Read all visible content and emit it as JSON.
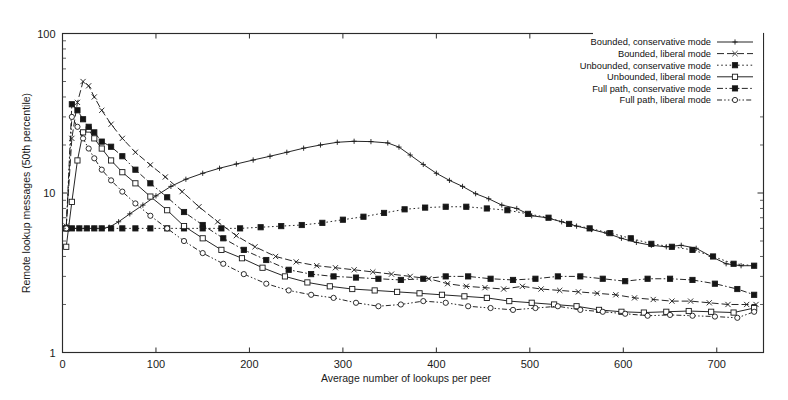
{
  "figure": {
    "background": "#ffffff",
    "ink_color": "#1a1a1a"
  },
  "axes": {
    "xlabel": "Average number of lookups per peer",
    "ylabel": "Remote lookup messages (50th percentile)",
    "x_ticks": [
      "0",
      "100",
      "200",
      "300",
      "400",
      "500",
      "600",
      "700"
    ],
    "y_ticks": [
      "1",
      "10",
      "100"
    ],
    "x_range": [
      0,
      750
    ],
    "y_range": [
      1,
      100
    ],
    "y_scale": "log",
    "x_scale": "linear",
    "grid": "off"
  },
  "legend": {
    "position": "top-right inside",
    "entries": [
      {
        "label": "Bounded, conservative mode",
        "marker": "plus",
        "dash": "solid"
      },
      {
        "label": "Bounded, liberal mode",
        "marker": "cross",
        "dash": "dashed"
      },
      {
        "label": "Unbounded, conservative mode",
        "marker": "filled-square-dot",
        "dash": "dotted"
      },
      {
        "label": "Unbounded, liberal mode",
        "marker": "open-square",
        "dash": "solid"
      },
      {
        "label": "Full path, conservative mode",
        "marker": "filled-square",
        "dash": "dash-dot"
      },
      {
        "label": "Full path, liberal mode",
        "marker": "open-circle",
        "dash": "dash-dot-dot"
      }
    ]
  },
  "chart_data": {
    "type": "line",
    "title": "",
    "xlabel": "Average number of lookups per peer",
    "ylabel": "Remote lookup messages (50th percentile)",
    "xlim": [
      0,
      750
    ],
    "ylim": [
      1,
      100
    ],
    "y_scale": "log",
    "grid": false,
    "legend_position": "top-right",
    "series": [
      {
        "name": "Bounded, conservative mode",
        "marker": "plus",
        "linestyle": "solid",
        "x": [
          4,
          10,
          18,
          26,
          34,
          42,
          50,
          60,
          72,
          86,
          100,
          116,
          132,
          150,
          168,
          186,
          204,
          222,
          240,
          258,
          276,
          294,
          312,
          330,
          348,
          360,
          372,
          386,
          400,
          414,
          428,
          442,
          456,
          470,
          486,
          502,
          518,
          534,
          550,
          566,
          582,
          598,
          614,
          630,
          646,
          662,
          678,
          694,
          710,
          726,
          740
        ],
        "y": [
          6.0,
          6.0,
          6.0,
          6.0,
          6.0,
          6.0,
          6.1,
          6.6,
          7.4,
          8.4,
          9.6,
          11.0,
          12.2,
          13.3,
          14.3,
          15.2,
          16.1,
          17.0,
          18.0,
          19.1,
          20.0,
          20.8,
          21.1,
          21.0,
          20.6,
          19.4,
          17.3,
          15.1,
          13.3,
          12.0,
          11.0,
          9.9,
          9.2,
          8.4,
          8.0,
          7.2,
          7.0,
          6.6,
          6.2,
          5.9,
          5.6,
          5.2,
          4.9,
          4.7,
          4.6,
          4.7,
          4.5,
          4.0,
          3.6,
          3.5,
          3.5
        ]
      },
      {
        "name": "Bounded, liberal mode",
        "marker": "cross",
        "linestyle": "dashed",
        "x": [
          4,
          10,
          16,
          22,
          28,
          34,
          42,
          52,
          64,
          78,
          94,
          110,
          128,
          146,
          166,
          186,
          206,
          228,
          250,
          272,
          292,
          312,
          332,
          352,
          372,
          392,
          412,
          432,
          452,
          472,
          492,
          512,
          532,
          552,
          572,
          592,
          612,
          632,
          652,
          672,
          692,
          712,
          732,
          742
        ],
        "y": [
          6.2,
          22.0,
          37.0,
          50.0,
          47.0,
          40.0,
          33.0,
          27.0,
          22.0,
          18.0,
          15.0,
          12.6,
          10.2,
          8.2,
          6.6,
          5.4,
          4.6,
          4.0,
          3.7,
          3.5,
          3.4,
          3.3,
          3.2,
          3.1,
          3.0,
          2.9,
          2.7,
          2.6,
          2.55,
          2.5,
          2.6,
          2.5,
          2.45,
          2.4,
          2.35,
          2.3,
          2.2,
          2.15,
          2.1,
          2.1,
          2.05,
          2.0,
          2.0,
          2.0
        ]
      },
      {
        "name": "Unbounded, conservative mode",
        "marker": "filled-square-dot",
        "linestyle": "dotted",
        "x": [
          4,
          10,
          18,
          26,
          34,
          42,
          52,
          64,
          78,
          94,
          112,
          130,
          150,
          170,
          190,
          212,
          234,
          256,
          278,
          300,
          322,
          344,
          366,
          388,
          410,
          432,
          454,
          476,
          498,
          520,
          542,
          564,
          586,
          608,
          630,
          652,
          674,
          696,
          718,
          740
        ],
        "y": [
          6.0,
          6.0,
          6.0,
          6.0,
          6.0,
          6.0,
          6.0,
          6.0,
          6.0,
          6.0,
          6.0,
          6.0,
          6.0,
          6.0,
          6.0,
          6.1,
          6.2,
          6.3,
          6.5,
          6.8,
          7.1,
          7.5,
          7.9,
          8.1,
          8.2,
          8.2,
          8.0,
          7.8,
          7.4,
          7.0,
          6.4,
          6.0,
          5.6,
          5.2,
          4.8,
          4.6,
          4.4,
          4.0,
          3.6,
          3.5
        ]
      },
      {
        "name": "Unbounded, liberal mode",
        "marker": "open-square",
        "linestyle": "solid",
        "x": [
          4,
          10,
          16,
          22,
          28,
          34,
          42,
          52,
          64,
          78,
          94,
          112,
          130,
          150,
          170,
          192,
          214,
          238,
          262,
          286,
          310,
          334,
          358,
          382,
          406,
          430,
          454,
          478,
          502,
          526,
          550,
          574,
          598,
          622,
          646,
          670,
          694,
          718,
          740
        ],
        "y": [
          4.6,
          8.8,
          16.0,
          24.0,
          25.0,
          22.0,
          19.0,
          16.0,
          13.5,
          11.5,
          9.5,
          7.8,
          6.2,
          5.2,
          4.4,
          3.9,
          3.4,
          3.0,
          2.75,
          2.6,
          2.5,
          2.45,
          2.4,
          2.35,
          2.3,
          2.25,
          2.2,
          2.1,
          2.05,
          2.0,
          1.95,
          1.85,
          1.8,
          1.78,
          1.8,
          1.82,
          1.8,
          1.78,
          1.9
        ]
      },
      {
        "name": "Full path, conservative mode",
        "marker": "filled-square",
        "linestyle": "dash-dot",
        "x": [
          4,
          10,
          16,
          22,
          28,
          34,
          42,
          52,
          64,
          78,
          94,
          112,
          130,
          150,
          172,
          194,
          218,
          242,
          266,
          290,
          314,
          338,
          362,
          386,
          410,
          434,
          458,
          482,
          506,
          530,
          554,
          578,
          602,
          626,
          650,
          674,
          698,
          722,
          740
        ],
        "y": [
          6.0,
          36.0,
          33.0,
          29.0,
          26.0,
          24.0,
          21.0,
          19.5,
          17.0,
          14.0,
          11.5,
          9.4,
          7.6,
          6.3,
          5.2,
          4.4,
          3.8,
          3.3,
          3.1,
          3.0,
          2.95,
          2.9,
          2.85,
          2.9,
          3.0,
          3.0,
          2.9,
          2.85,
          2.9,
          3.0,
          3.0,
          2.9,
          2.8,
          2.9,
          2.9,
          2.85,
          2.7,
          2.5,
          2.3
        ]
      },
      {
        "name": "Full path, liberal mode",
        "marker": "open-circle",
        "linestyle": "dash-dot-dot",
        "x": [
          4,
          10,
          16,
          22,
          28,
          34,
          42,
          52,
          64,
          78,
          94,
          112,
          130,
          150,
          172,
          194,
          218,
          242,
          266,
          290,
          314,
          338,
          362,
          386,
          410,
          434,
          458,
          482,
          506,
          530,
          554,
          578,
          602,
          626,
          650,
          674,
          698,
          722,
          740
        ],
        "y": [
          6.0,
          30.0,
          26.0,
          22.0,
          19.0,
          16.5,
          14.0,
          12.0,
          10.2,
          8.6,
          7.2,
          6.0,
          5.0,
          4.2,
          3.6,
          3.1,
          2.7,
          2.45,
          2.3,
          2.2,
          2.05,
          1.95,
          2.0,
          2.1,
          2.05,
          1.95,
          1.9,
          1.85,
          1.9,
          1.95,
          1.85,
          1.8,
          1.75,
          1.7,
          1.72,
          1.7,
          1.68,
          1.65,
          1.8
        ]
      }
    ]
  }
}
